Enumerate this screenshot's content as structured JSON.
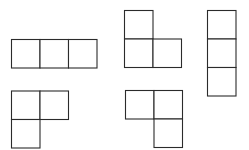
{
  "figure": {
    "caption_visible_fragment": "",
    "line_color": "#2b2b2b",
    "background": "#ffffff",
    "shapes": [
      {
        "name": "tromino-horizontal-i",
        "cells": [
          [
            0,
            0
          ],
          [
            1,
            0
          ],
          [
            2,
            0
          ]
        ]
      },
      {
        "name": "tromino-l-up",
        "cells": [
          [
            0,
            0
          ],
          [
            0,
            1
          ],
          [
            1,
            1
          ]
        ]
      },
      {
        "name": "tromino-vertical-i",
        "cells": [
          [
            0,
            0
          ],
          [
            0,
            1
          ],
          [
            0,
            2
          ]
        ]
      },
      {
        "name": "tromino-l-down-left",
        "cells": [
          [
            0,
            0
          ],
          [
            1,
            0
          ],
          [
            0,
            1
          ]
        ]
      },
      {
        "name": "tromino-l-down-right",
        "cells": [
          [
            0,
            0
          ],
          [
            1,
            0
          ],
          [
            1,
            1
          ]
        ]
      }
    ]
  }
}
